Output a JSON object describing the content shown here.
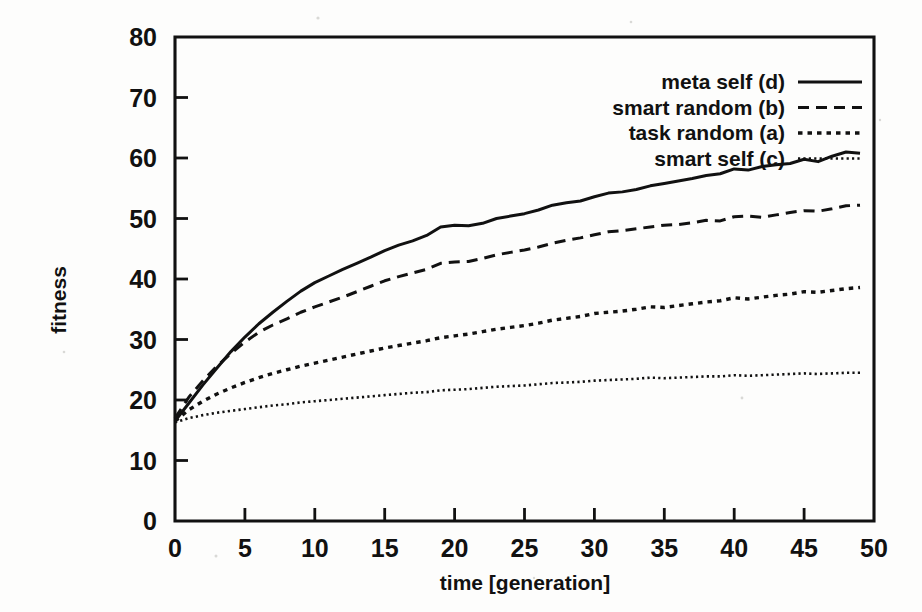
{
  "chart_data": {
    "type": "line",
    "title": "",
    "xlabel": "time [generation]",
    "ylabel": "fitness",
    "xlim": [
      0,
      50
    ],
    "ylim": [
      0,
      80
    ],
    "xticks": [
      0,
      5,
      10,
      15,
      20,
      25,
      30,
      35,
      40,
      45,
      50
    ],
    "xticklabels": [
      "0",
      "5",
      "10",
      "15",
      "20",
      "25",
      "30",
      "35",
      "40",
      "45",
      "50"
    ],
    "yticks": [
      0,
      10,
      20,
      30,
      40,
      50,
      60,
      70,
      80
    ],
    "yticklabels": [
      "0",
      "10",
      "20",
      "30",
      "40",
      "50",
      "60",
      "70",
      "80"
    ],
    "grid": false,
    "legend_position": "top-right",
    "x": [
      0,
      1,
      2,
      3,
      4,
      5,
      6,
      7,
      8,
      9,
      10,
      11,
      12,
      13,
      14,
      15,
      16,
      17,
      18,
      19,
      20,
      21,
      22,
      23,
      24,
      25,
      26,
      27,
      28,
      29,
      30,
      31,
      32,
      33,
      34,
      35,
      36,
      37,
      38,
      39,
      40,
      41,
      42,
      43,
      44,
      45,
      46,
      47,
      48,
      49
    ],
    "series": [
      {
        "name": "meta self (d)",
        "code": "d",
        "linestyle": "solid",
        "color": "#111111",
        "values": [
          16.5,
          19.5,
          22.5,
          25.3,
          28.0,
          30.4,
          32.6,
          34.5,
          36.3,
          38.0,
          39.4,
          40.5,
          41.6,
          42.6,
          43.6,
          44.7,
          45.6,
          46.3,
          47.2,
          48.6,
          48.9,
          48.8,
          49.2,
          50.0,
          50.4,
          50.8,
          51.4,
          52.2,
          52.6,
          52.9,
          53.6,
          54.2,
          54.4,
          54.8,
          55.4,
          55.8,
          56.2,
          56.6,
          57.1,
          57.4,
          58.2,
          58.0,
          58.6,
          58.9,
          59.1,
          59.8,
          59.4,
          60.3,
          61.0,
          60.8
        ]
      },
      {
        "name": "smart random (b)",
        "code": "b",
        "linestyle": "dashed",
        "color": "#111111",
        "values": [
          17.0,
          20.5,
          23.2,
          25.6,
          27.7,
          29.6,
          31.2,
          32.4,
          33.4,
          34.5,
          35.4,
          36.2,
          37.0,
          37.9,
          38.8,
          39.7,
          40.4,
          41.0,
          41.6,
          42.6,
          42.8,
          42.9,
          43.4,
          44.0,
          44.4,
          44.8,
          45.3,
          45.9,
          46.4,
          46.8,
          47.3,
          47.8,
          48.0,
          48.3,
          48.6,
          48.9,
          49.0,
          49.3,
          49.7,
          49.6,
          50.3,
          50.4,
          50.2,
          50.6,
          51.0,
          51.3,
          51.2,
          51.6,
          52.1,
          52.2
        ]
      },
      {
        "name": "task random (a)",
        "code": "a",
        "linestyle": "dotted",
        "color": "#111111",
        "values": [
          16.5,
          18.4,
          19.8,
          21.0,
          22.0,
          22.9,
          23.7,
          24.4,
          25.0,
          25.6,
          26.1,
          26.6,
          27.1,
          27.6,
          28.1,
          28.6,
          29.0,
          29.4,
          29.8,
          30.3,
          30.6,
          30.9,
          31.3,
          31.7,
          32.0,
          32.3,
          32.7,
          33.2,
          33.5,
          33.8,
          34.3,
          34.5,
          34.7,
          35.0,
          35.4,
          35.3,
          35.6,
          35.9,
          36.2,
          36.4,
          36.9,
          36.7,
          37.0,
          37.3,
          37.5,
          37.9,
          37.8,
          38.1,
          38.4,
          38.6
        ]
      },
      {
        "name": "smart self (c)",
        "code": "c",
        "linestyle": "fine-dotted",
        "color": "#111111",
        "values": [
          16.3,
          17.0,
          17.5,
          17.9,
          18.2,
          18.5,
          18.8,
          19.1,
          19.3,
          19.6,
          19.8,
          20.0,
          20.2,
          20.4,
          20.6,
          20.8,
          21.0,
          21.2,
          21.3,
          21.6,
          21.7,
          21.8,
          22.0,
          22.2,
          22.3,
          22.4,
          22.6,
          22.8,
          22.9,
          23.0,
          23.2,
          23.3,
          23.4,
          23.5,
          23.7,
          23.6,
          23.7,
          23.8,
          23.9,
          23.9,
          24.1,
          24.0,
          24.1,
          24.2,
          24.3,
          24.4,
          24.3,
          24.4,
          24.5,
          24.5
        ]
      }
    ]
  },
  "legend": {
    "entries": [
      {
        "label": "meta self (d)",
        "style": "solid"
      },
      {
        "label": "smart random (b)",
        "style": "dashed"
      },
      {
        "label": "task random (a)",
        "style": "dotted"
      },
      {
        "label": "smart self (c)",
        "style": "fine-dotted"
      }
    ]
  },
  "colors": {
    "ink": "#111111",
    "background": "#fdfdfc"
  }
}
